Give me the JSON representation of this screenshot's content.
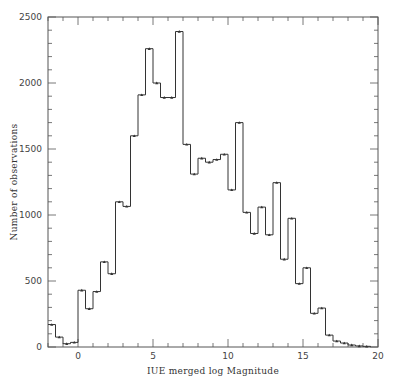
{
  "chart_data": {
    "type": "bar",
    "style": "step-histogram",
    "title": "",
    "xlabel": "IUE merged log Magnitude",
    "ylabel": "Number of observations",
    "xlim": [
      -2,
      20
    ],
    "ylim": [
      0,
      2500
    ],
    "x_ticks": [
      0,
      5,
      10,
      15,
      20
    ],
    "x_tick_labels": [
      "0",
      "5",
      "10",
      "15",
      "20"
    ],
    "y_ticks": [
      0,
      500,
      1000,
      1500,
      2000,
      2500
    ],
    "y_tick_labels": [
      "0",
      "500",
      "1000",
      "1500",
      "2000",
      "2500"
    ],
    "grid": false,
    "legend": null,
    "bin_width": 0.5,
    "bin_edges_start": -2,
    "categories": [
      "-2.0",
      "-1.5",
      "-1.0",
      "-0.5",
      "0.0",
      "0.5",
      "1.0",
      "1.5",
      "2.0",
      "2.5",
      "3.0",
      "3.5",
      "4.0",
      "4.5",
      "5.0",
      "5.5",
      "6.0",
      "6.5",
      "7.0",
      "7.5",
      "8.0",
      "8.5",
      "9.0",
      "9.5",
      "10.0",
      "10.5",
      "11.0",
      "11.5",
      "12.0",
      "12.5",
      "13.0",
      "13.5",
      "14.0",
      "14.5",
      "15.0",
      "15.5",
      "16.0",
      "16.5",
      "17.0",
      "17.5",
      "18.0",
      "18.5",
      "19.0"
    ],
    "values": [
      170,
      75,
      25,
      35,
      430,
      290,
      420,
      645,
      555,
      1100,
      1065,
      1600,
      1910,
      2260,
      2000,
      1890,
      1890,
      2390,
      1535,
      1310,
      1430,
      1400,
      1420,
      1460,
      1190,
      1700,
      1020,
      860,
      1060,
      850,
      1245,
      665,
      975,
      480,
      600,
      255,
      295,
      90,
      45,
      30,
      15,
      8,
      5
    ]
  },
  "colors": {
    "line": "#333333",
    "frame": "#555555",
    "background": "#ffffff"
  }
}
